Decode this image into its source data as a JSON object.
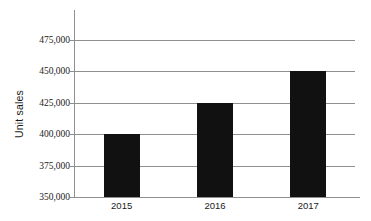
{
  "chart_data": {
    "type": "bar",
    "title": "",
    "xlabel": "",
    "ylabel": "Unit sales",
    "categories": [
      "2015",
      "2016",
      "2017"
    ],
    "values": [
      400000,
      425000,
      450000
    ],
    "ytick_labels": [
      "475,000",
      "450,000",
      "425,000",
      "400,000",
      "375,000",
      "350,000"
    ],
    "ytick_values": [
      475000,
      450000,
      425000,
      400000,
      375000,
      350000
    ],
    "ylim": [
      350000,
      475000
    ],
    "grid": "horizontal",
    "legend": "none",
    "bar_color": "#111111",
    "grid_color": "#8f8f8f",
    "background_color": "#ffffff",
    "series": [
      {
        "name": "Unit sales",
        "values": [
          400000,
          425000,
          450000
        ]
      }
    ]
  }
}
